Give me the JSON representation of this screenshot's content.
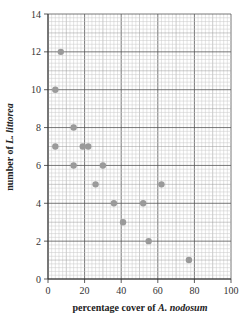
{
  "chart_data": {
    "type": "scatter",
    "title": "",
    "xlabel": "percentage cover of A. nodosum",
    "xlabel_parts": [
      "percentage cover of ",
      "A. nodosum"
    ],
    "ylabel": "number of L. littorea",
    "ylabel_parts": [
      "number of ",
      "L. littorea"
    ],
    "xlim": [
      0,
      100
    ],
    "ylim": [
      0,
      14
    ],
    "xticks": [
      0,
      20,
      40,
      60,
      80,
      100
    ],
    "yticks": [
      0,
      2,
      4,
      6,
      8,
      10,
      12,
      14
    ],
    "grid": "graph paper (major every 20 x / 2 y, minor every 2 x / 0.2 y)",
    "marker_color": "#9a9a9a",
    "series": [
      {
        "name": "quadrats",
        "points": [
          {
            "x": 7,
            "y": 12
          },
          {
            "x": 4,
            "y": 10
          },
          {
            "x": 14,
            "y": 8
          },
          {
            "x": 4,
            "y": 7
          },
          {
            "x": 19,
            "y": 7
          },
          {
            "x": 22,
            "y": 7
          },
          {
            "x": 14,
            "y": 6
          },
          {
            "x": 30,
            "y": 6
          },
          {
            "x": 26,
            "y": 5
          },
          {
            "x": 36,
            "y": 4
          },
          {
            "x": 41,
            "y": 3
          },
          {
            "x": 52,
            "y": 4
          },
          {
            "x": 62,
            "y": 5
          },
          {
            "x": 55,
            "y": 2
          },
          {
            "x": 77,
            "y": 1
          }
        ]
      }
    ]
  }
}
